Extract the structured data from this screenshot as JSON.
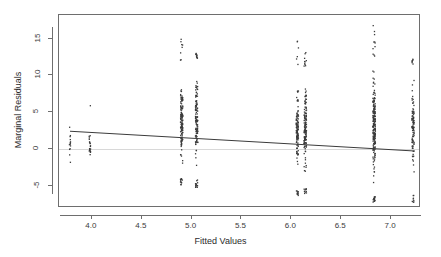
{
  "chart_data": {
    "type": "scatter",
    "title": "",
    "xlabel": "Fitted Values",
    "ylabel": "Marginal Residuals",
    "xlim": [
      3.67,
      7.3
    ],
    "ylim": [
      -8.0,
      18.2
    ],
    "grid": false,
    "legend": null,
    "xticks": [
      4.0,
      4.5,
      5.0,
      5.5,
      6.0,
      6.5,
      7.0
    ],
    "xticklabels": [
      "4.0",
      "4.5",
      "5.0",
      "5.5",
      "6.0",
      "6.5",
      "7.0"
    ],
    "yticks": [
      -5,
      0,
      5,
      10,
      15
    ],
    "yticklabels": [
      "-5",
      "0",
      "5",
      "10",
      "15"
    ],
    "point_color": "#3b3b3b",
    "point_size": 1.3,
    "reference_line": {
      "type": "horizontal",
      "y": 0,
      "color": "#d8d8d8"
    },
    "trend_line": {
      "color": "#3b3b3b",
      "x_start": 3.78,
      "y_start": 2.42,
      "x_end": 7.22,
      "y_end": -0.25
    },
    "clusters": [
      {
        "x": 3.78,
        "n": 14,
        "y_min": -2.2,
        "y_max": 14.7,
        "dense_lo": -1.5,
        "dense_hi": 5.2,
        "weight": 0.2
      },
      {
        "x": 3.98,
        "n": 22,
        "y_min": -2.6,
        "y_max": 9.7,
        "dense_lo": -2.2,
        "dense_hi": 2.6,
        "weight": 0.28
      },
      {
        "x": 4.9,
        "n": 150,
        "y_min": -5.0,
        "y_max": 15.6,
        "dense_lo": -4.0,
        "dense_hi": 11.8,
        "weight": 0.85
      },
      {
        "x": 5.05,
        "n": 140,
        "y_min": -5.2,
        "y_max": 13.2,
        "dense_lo": -4.2,
        "dense_hi": 12.3,
        "weight": 0.82
      },
      {
        "x": 6.06,
        "n": 130,
        "y_min": -6.3,
        "y_max": 15.3,
        "dense_lo": -5.6,
        "dense_hi": 10.5,
        "weight": 0.8
      },
      {
        "x": 6.14,
        "n": 155,
        "y_min": -6.2,
        "y_max": 13.1,
        "dense_lo": -5.4,
        "dense_hi": 11.2,
        "weight": 0.88
      },
      {
        "x": 6.83,
        "n": 230,
        "y_min": -7.2,
        "y_max": 17.4,
        "dense_lo": -6.4,
        "dense_hi": 12.6,
        "weight": 0.97
      },
      {
        "x": 7.22,
        "n": 120,
        "y_min": -7.3,
        "y_max": 12.2,
        "dense_lo": -6.0,
        "dense_hi": 11.4,
        "weight": 0.78
      }
    ]
  }
}
